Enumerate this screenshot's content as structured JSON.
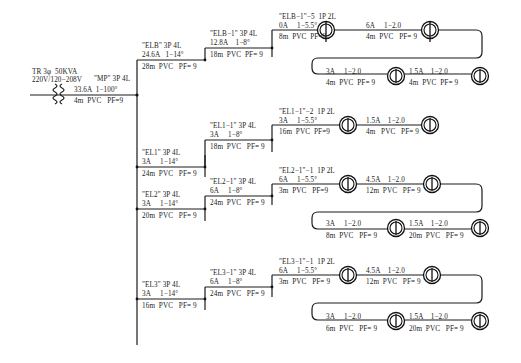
{
  "diagram": {
    "transformer": {
      "label_line1": "TR 3φ  50KVA",
      "label_line2": "220V/120−208V",
      "symbol": "transformer-coil-icon"
    },
    "main_panel": {
      "name": "\"MP\" 3P 4L",
      "rating": "33.6A  1−100°",
      "cable": "4m  PVC   PF=9"
    },
    "panels": [
      {
        "id": "ELB",
        "name": "\"ELB\" 3P 4L",
        "rating": "24.6A   1−14°",
        "cable": "28m  PVC   PF= 9",
        "sub": {
          "name": "\"ELB−1\" 3P 4L",
          "rating": "12.8A    1−8°",
          "cable": "18m  PVC  PF= 9",
          "circuit": {
            "name": "\"ELB−1\"−5  1P 2L",
            "rating": "0A     1−5.5°",
            "cable": "8m  PVC  PF=9",
            "segments": [
              {
                "rating": "6A     1−2.0",
                "cable": "4m  PVC   PF= 9"
              },
              {
                "rating": "3A     1−2.0",
                "cable": "4m  PVC  PF= 9"
              },
              {
                "rating": "1.5A    1−2.0",
                "cable": "4m  PVC  PF= 9"
              }
            ]
          }
        }
      },
      {
        "id": "EL1",
        "name": "\"EL1\" 3P 4L",
        "rating": "3A     1−14°",
        "cable": "24m  PVC   PF= 9",
        "sub": {
          "name": "\"EL1−1\" 3P 4L",
          "rating": "3A     1−8°",
          "cable": "18m  PVC   PF= 9",
          "circuit": {
            "name": "\"EL1−1\"−2  1P 2L",
            "rating": "3A     1−5.5°",
            "cable": "16m  PVC  PF=9",
            "segments": [
              {
                "rating": "1.5A    1−2.0",
                "cable": "4m   PVC   PF= 9"
              }
            ]
          }
        }
      },
      {
        "id": "EL2",
        "name": "\"EL2\" 3P 4L",
        "rating": "3A     1−14°",
        "cable": "20m  PVC   PF= 9",
        "sub": {
          "name": "\"EL2−1\" 3P 4L",
          "rating": "6A     1−8°",
          "cable": "24m  PVC   PF= 9",
          "circuit": {
            "name": "\"EL2−1\"−1  1P 2L",
            "rating": "6A     1−5.5°",
            "cable": "3m  PVC   PF=9",
            "segments": [
              {
                "rating": "4.5A    1−2.0",
                "cable": "12m  PVC   PF= 9"
              },
              {
                "rating": "3A     1−2.0",
                "cable": "8m  PVC   PF= 9"
              },
              {
                "rating": "1.5A    1−2.0",
                "cable": "20m  PVC   PF= 9"
              }
            ]
          }
        }
      },
      {
        "id": "EL3",
        "name": "\"EL3\" 3P 4L",
        "rating": "3A     1−14°",
        "cable": "16m  PVC   PF= 9",
        "sub": {
          "name": "\"EL3−1\" 3P 4L",
          "rating": "6A     1−8°",
          "cable": "24m  PVC   PF= 9",
          "circuit": {
            "name": "\"EL3−1\"−1  1P 2L",
            "rating": "6A     1−5.5°",
            "cable": "3m  PVC   PF= 9",
            "segments": [
              {
                "rating": "4.5A    1−2.0",
                "cable": "12m  PVC   PF= 9"
              },
              {
                "rating": "3A     1−2.0",
                "cable": "6m  PVC   PF= 9"
              },
              {
                "rating": "1.5A    1−2.0",
                "cable": "20m  PVC   PF= 9"
              }
            ]
          }
        }
      }
    ],
    "symbols": {
      "lamp": "lamp-outlet-icon",
      "junction": "junction-dot-icon"
    },
    "colors": {
      "line": "#1a1a1a",
      "text": "#222222",
      "background": "#ffffff"
    }
  }
}
